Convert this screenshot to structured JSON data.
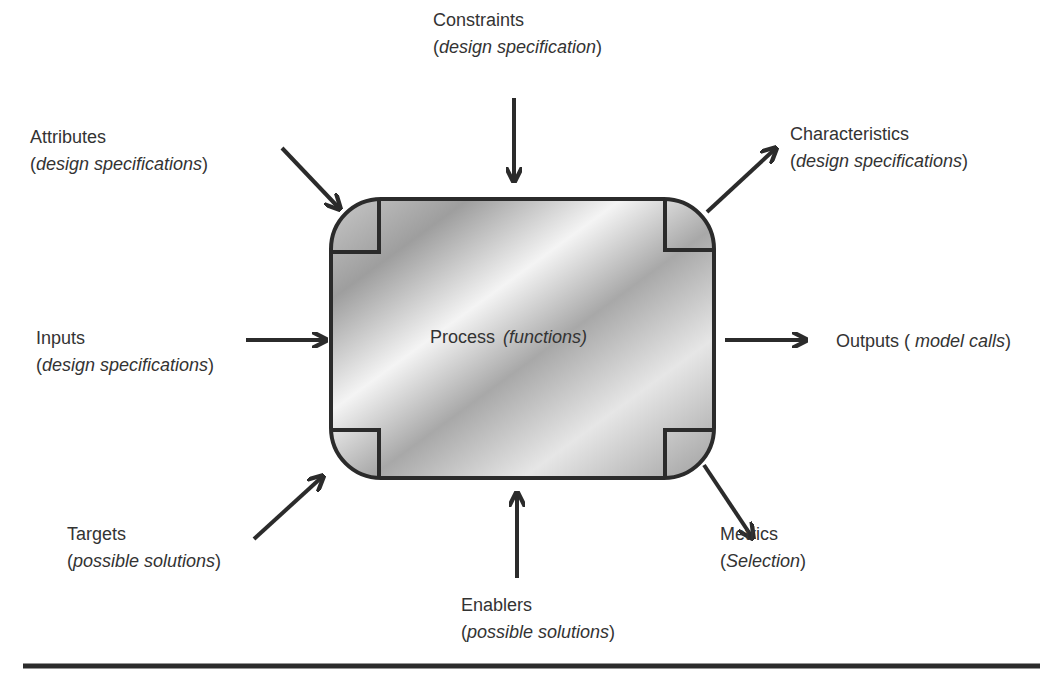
{
  "process": {
    "label": "Process",
    "detail": "(functions)"
  },
  "nodes": {
    "constraints": {
      "title": "Constraints",
      "open": "(",
      "detail": "design specification",
      "close": ")"
    },
    "attributes": {
      "title": "Attributes",
      "open": "(",
      "detail": "design specifications",
      "close": ")"
    },
    "characteristics": {
      "title": "Characteristics",
      "open": "(",
      "detail": "design specifications",
      "close": ")"
    },
    "inputs": {
      "title": "Inputs",
      "open": "(",
      "detail": "design specifications",
      "close": ")"
    },
    "outputs": {
      "title": "Outputs (",
      "detail": " model calls",
      "close": ")"
    },
    "targets": {
      "title": "Targets",
      "open": "(",
      "detail": "possible solutions",
      "close": ")"
    },
    "enablers": {
      "title": "Enablers",
      "open": "(",
      "detail": "possible solutions",
      "close": ")"
    },
    "metrics": {
      "title": "Metrics",
      "open": "(",
      "detail": "Selection",
      "close": ")"
    }
  },
  "colors": {
    "stroke": "#2b2b2b",
    "text": "#333333",
    "box_light": "#f2f2f2",
    "box_dark": "#9a9a9a"
  }
}
